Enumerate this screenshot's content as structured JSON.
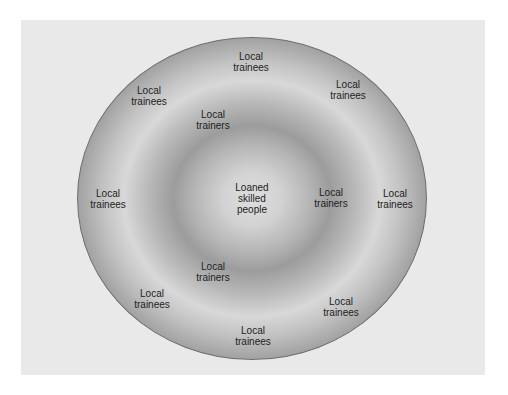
{
  "diagram": {
    "type": "concentric-rings",
    "center": {
      "label": "Loaned\nskilled\npeople"
    },
    "inner_ring": {
      "label_text": "Local\ntrainers",
      "positions": [
        {
          "label": "Local\ntrainers",
          "x": 213,
          "y": 120
        },
        {
          "label": "Local\ntrainers",
          "x": 331,
          "y": 198
        },
        {
          "label": "Local\ntrainers",
          "x": 213,
          "y": 272
        }
      ]
    },
    "outer_ring": {
      "label_text": "Local\ntrainees",
      "positions": [
        {
          "label": "Local\ntrainees",
          "x": 251,
          "y": 62
        },
        {
          "label": "Local\ntrainees",
          "x": 348,
          "y": 90
        },
        {
          "label": "Local\ntrainees",
          "x": 149,
          "y": 96
        },
        {
          "label": "Local\ntrainees",
          "x": 108,
          "y": 199
        },
        {
          "label": "Local\ntrainees",
          "x": 395,
          "y": 199
        },
        {
          "label": "Local\ntrainees",
          "x": 152,
          "y": 299
        },
        {
          "label": "Local\ntrainees",
          "x": 341,
          "y": 307
        },
        {
          "label": "Local\ntrainees",
          "x": 253,
          "y": 336
        }
      ]
    }
  },
  "colors": {
    "panel": "#e9e9e9",
    "ring_dark": "#909090",
    "ring_light": "#dedede",
    "text": "#222222"
  }
}
